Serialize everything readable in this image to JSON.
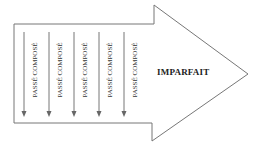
{
  "diagram": {
    "shape": "block-arrow-right",
    "stroke_color": "#777777",
    "fill_color": "#ffffff",
    "arrows_label": "PASSÉ COMPOSÉ",
    "vertical_items": [
      {
        "label": "PASSÉ COMPOSÉ"
      },
      {
        "label": "PASSÉ COMPOSÉ"
      },
      {
        "label": "PASSÉ COMPOSÉ"
      },
      {
        "label": "PASSÉ COMPOSÉ"
      },
      {
        "label": "PASSÉ COMPOSÉ"
      }
    ],
    "main_label": "IMPARFAIT"
  }
}
